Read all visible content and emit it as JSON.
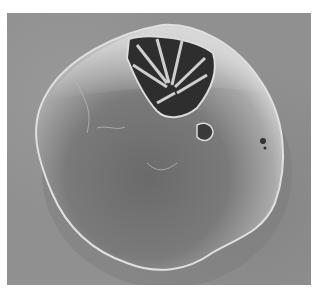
{
  "image": {
    "kind": "scanning-electron-micrograph",
    "subject": "rounded spherical particle with fractured crystalline opening at top",
    "colors": {
      "background": "#909090",
      "particle_light": "#c8c8c8",
      "particle_dark": "#6e6e6e",
      "cavity": "#2a2a2a",
      "page": "#ffffff"
    }
  }
}
